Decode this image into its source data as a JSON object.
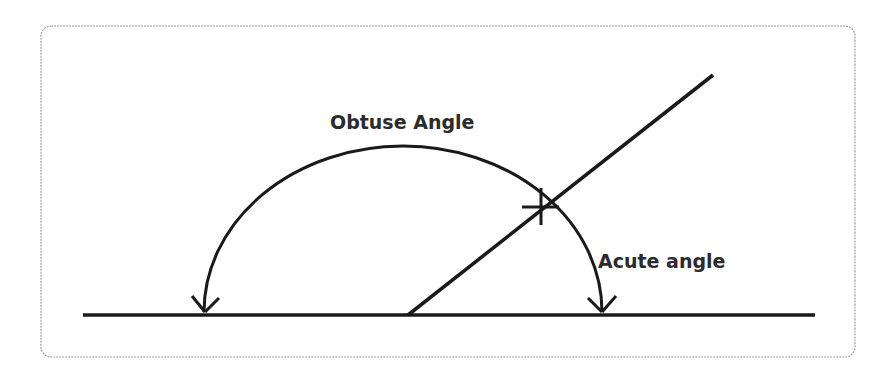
{
  "diagram": {
    "labels": {
      "obtuse": "Obtuse Angle",
      "acute": "Acute angle"
    },
    "colors": {
      "line": "#1a1a1a",
      "text": "#2b2b2b",
      "frame": "#9a9a9a",
      "background": "#ffffff"
    }
  }
}
